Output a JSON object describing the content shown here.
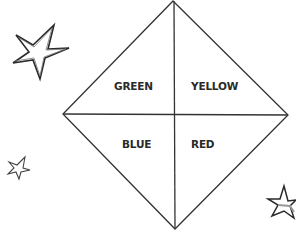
{
  "diagram": {
    "type": "paper-fortune-teller-quadrant",
    "line_color": "#333333",
    "background_color": "#ffffff",
    "quadrants": [
      {
        "position": "top-left",
        "label": "GREEN"
      },
      {
        "position": "top-right",
        "label": "YELLOW"
      },
      {
        "position": "bottom-left",
        "label": "BLUE"
      },
      {
        "position": "bottom-right",
        "label": "RED"
      }
    ],
    "decorations": [
      {
        "name": "star-icon",
        "position": "top-left",
        "size": "large"
      },
      {
        "name": "star-icon",
        "position": "bottom-left",
        "size": "small"
      },
      {
        "name": "star-icon",
        "position": "bottom-right",
        "size": "medium"
      }
    ]
  }
}
